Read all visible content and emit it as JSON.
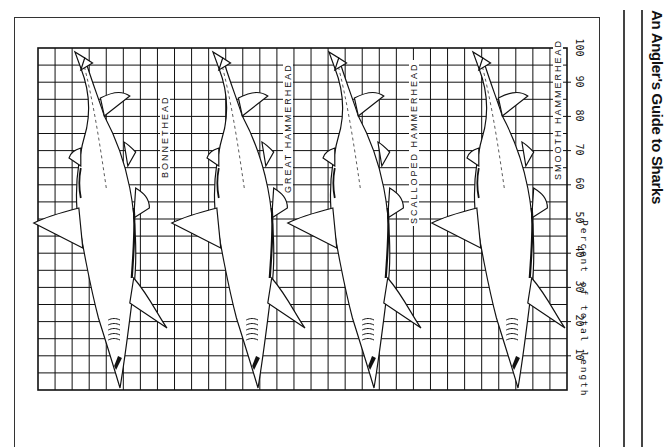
{
  "page": {
    "running_head": "An Angler's Guide to Sharks"
  },
  "figure": {
    "axis_label": "Percent of total length",
    "ticks": [
      "10",
      "20",
      "30",
      "40",
      "50",
      "60",
      "70",
      "80",
      "90",
      "100"
    ],
    "species": [
      {
        "label": "BONNETHEAD"
      },
      {
        "label": "GREAT HAMMERHEAD"
      },
      {
        "label": "SCALLOPED HAMMERHEAD"
      },
      {
        "label": "SMOOTH HAMMERHEAD"
      }
    ]
  },
  "colors": {
    "ink": "#111111",
    "paper": "#ffffff"
  }
}
